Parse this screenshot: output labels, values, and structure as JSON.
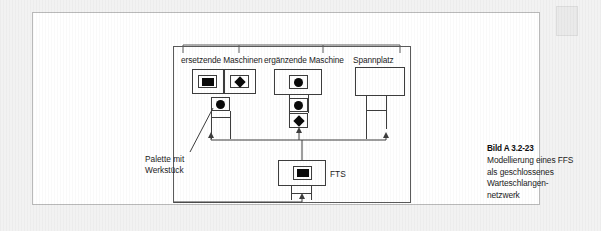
{
  "figure": {
    "group_labels": [
      {
        "id": "ersetzende",
        "text": "ersetzende Maschinen"
      },
      {
        "id": "ergaenzende",
        "text": "ergänzende Maschine"
      },
      {
        "id": "spannplatz",
        "text": "Spannplatz"
      }
    ],
    "annotations": {
      "palette_line1": "Palette mit",
      "palette_line2": "Werkstück",
      "fts": "FTS"
    },
    "stations": [
      {
        "id": "ersetzende-maschinen",
        "label": "ersetzende Maschinen",
        "servers": [
          {
            "glyph": "square",
            "name": "server-glyph-square"
          },
          {
            "glyph": "diamond",
            "name": "server-glyph-diamond"
          }
        ],
        "queue": [
          {
            "glyph": "circle",
            "name": "queue-glyph-circle"
          }
        ]
      },
      {
        "id": "ergaenzende-maschine",
        "label": "ergänzende Maschine",
        "servers": [
          {
            "glyph": "circle",
            "name": "server-glyph-circle"
          }
        ],
        "queue": [
          {
            "glyph": "circle",
            "name": "queue-glyph-circle"
          },
          {
            "glyph": "diamond",
            "name": "queue-glyph-diamond"
          }
        ]
      },
      {
        "id": "spannplatz",
        "label": "Spannplatz",
        "servers": [],
        "queue": []
      },
      {
        "id": "fts",
        "label": "FTS",
        "servers": [
          {
            "glyph": "square",
            "name": "server-glyph-square"
          }
        ],
        "queue": []
      }
    ],
    "colors": {
      "line": "#3d3d3d",
      "frame": "#5a5a5a",
      "glyph": "#0a0a0a",
      "page_background": "#f2f2f2",
      "panel_background": "#ffffff"
    }
  },
  "caption": {
    "title": "Bild A 3.2-23",
    "lines": [
      "Modellierung eines FFS",
      "als geschlossenes",
      "Warteschlangen-",
      "netzwerk"
    ]
  }
}
